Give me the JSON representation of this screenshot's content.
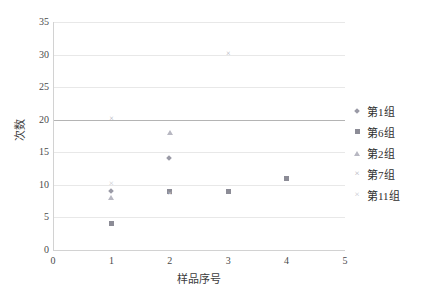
{
  "chart_data": {
    "type": "scatter",
    "title": "",
    "xlabel": "样品序号",
    "ylabel": "次数",
    "xlim": [
      0,
      5
    ],
    "ylim": [
      0,
      35
    ],
    "xticks": [
      "0",
      "1",
      "2",
      "3",
      "4",
      "5"
    ],
    "yticks": [
      "0",
      "5",
      "10",
      "15",
      "20",
      "25",
      "30",
      "35"
    ],
    "ytick_step": 5,
    "xtick_step": 1,
    "grid": "horizontal",
    "emphasis_gridline_y": 20,
    "legend_position": "right",
    "colors": {
      "grid": "#e8e8e8",
      "grid_emphasis": "#b4b4b4",
      "axis": "#d2d2d2",
      "text": "#3c3c3c",
      "series_1": "#9a9aa6",
      "series_6": "#8c8c96",
      "series_2": "#b8b8c2",
      "series_7": "#b0b0ba",
      "series_11": "#c6c6ce"
    },
    "series": [
      {
        "name": "第1组",
        "marker": "diamond",
        "color": "#9a9aa6",
        "points": [
          {
            "x": 1,
            "y": 9
          },
          {
            "x": 2,
            "y": 14
          }
        ]
      },
      {
        "name": "第6组",
        "marker": "square",
        "color": "#8c8c96",
        "points": [
          {
            "x": 1,
            "y": 4
          },
          {
            "x": 2,
            "y": 9
          },
          {
            "x": 3,
            "y": 9
          },
          {
            "x": 4,
            "y": 11
          }
        ]
      },
      {
        "name": "第2组",
        "marker": "triangle",
        "color": "#b8b8c2",
        "points": [
          {
            "x": 1,
            "y": 8
          },
          {
            "x": 2,
            "y": 18
          }
        ]
      },
      {
        "name": "第7组",
        "marker": "cross",
        "color": "#b0b0ba",
        "points": [
          {
            "x": 1,
            "y": 20
          },
          {
            "x": 3,
            "y": 30
          }
        ]
      },
      {
        "name": "第11组",
        "marker": "cross2",
        "color": "#c6c6ce",
        "points": [
          {
            "x": 1,
            "y": 10
          },
          {
            "x": 2,
            "y": 8.5
          }
        ]
      }
    ]
  },
  "legend": {
    "items": [
      {
        "label": "第1组",
        "marker": "diamond"
      },
      {
        "label": "第6组",
        "marker": "square"
      },
      {
        "label": "第2组",
        "marker": "triangle"
      },
      {
        "label": "第7组",
        "marker": "cross"
      },
      {
        "label": "第11组",
        "marker": "cross2"
      }
    ]
  }
}
